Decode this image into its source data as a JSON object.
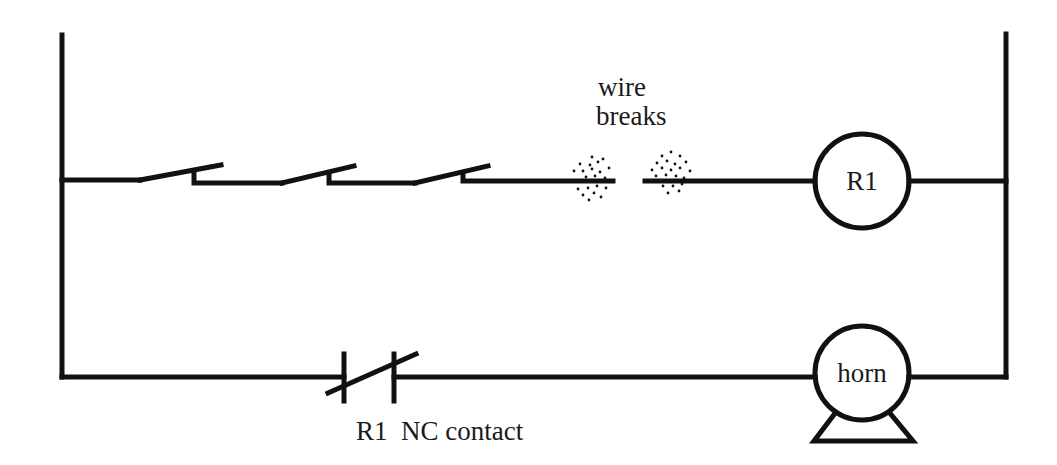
{
  "diagram": {
    "type": "ladder-logic",
    "stroke_color": "#111111",
    "background": "#ffffff",
    "rails": {
      "left": {
        "x": 62,
        "y_top": 35,
        "y_bottom": 377
      },
      "right": {
        "x": 1006,
        "y_top": 34,
        "y_bottom": 377
      }
    },
    "rungs": [
      {
        "name": "rung-1",
        "y": 181,
        "elements": [
          {
            "kind": "no-switch",
            "label": "",
            "x_start": 140
          },
          {
            "kind": "no-switch",
            "label": "",
            "x_start": 282
          },
          {
            "kind": "no-switch",
            "label": "",
            "x_start": 415
          },
          {
            "kind": "wire-break",
            "label": "wire breaks"
          },
          {
            "kind": "coil",
            "label": "R1"
          }
        ]
      },
      {
        "name": "rung-2",
        "y": 377,
        "elements": [
          {
            "kind": "nc-contact",
            "label": "R1  NC contact"
          },
          {
            "kind": "horn",
            "label": "horn"
          }
        ]
      }
    ]
  },
  "labels": {
    "wire_break_line1": "wire",
    "wire_break_line2": "breaks",
    "coil": "R1",
    "horn": "horn",
    "nc_contact": "R1  NC contact"
  }
}
